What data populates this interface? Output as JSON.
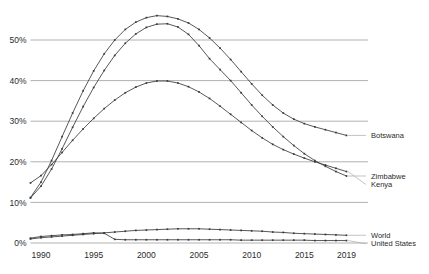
{
  "chart_data": {
    "type": "line",
    "title": "",
    "subtitle": "",
    "xlabel": "",
    "ylabel": "",
    "xlim": [
      1989,
      2020
    ],
    "ylim": [
      0,
      58
    ],
    "grid": "horizontal",
    "legend_position": "right-inline",
    "y_ticks": [
      "0%",
      "10%",
      "20%",
      "30%",
      "40%",
      "50%"
    ],
    "y_tick_values": [
      0,
      10,
      20,
      30,
      40,
      50
    ],
    "x_ticks": [
      "1990",
      "1995",
      "2000",
      "2005",
      "2010",
      "2015",
      "2019"
    ],
    "x_tick_values": [
      1990,
      1995,
      2000,
      2005,
      2010,
      2015,
      2019
    ],
    "x": [
      1989,
      1990,
      1991,
      1992,
      1993,
      1994,
      1995,
      1996,
      1997,
      1998,
      1999,
      2000,
      2001,
      2002,
      2003,
      2004,
      2005,
      2006,
      2007,
      2008,
      2009,
      2010,
      2011,
      2012,
      2013,
      2014,
      2015,
      2016,
      2017,
      2018,
      2019
    ],
    "series": [
      {
        "name": "Botswana",
        "color": "#3a3a3a",
        "values": [
          11.2,
          15.0,
          20.3,
          26.2,
          32.0,
          37.5,
          42.4,
          46.6,
          50.0,
          52.6,
          54.4,
          55.5,
          56.0,
          55.8,
          55.2,
          54.2,
          52.6,
          50.5,
          48.0,
          45.2,
          42.2,
          39.2,
          36.4,
          34.0,
          32.0,
          30.5,
          29.4,
          28.6,
          27.9,
          27.2,
          26.5
        ]
      },
      {
        "name": "Zimbabwe",
        "color": "#3a3a3a",
        "values": [
          11.1,
          14.0,
          18.2,
          23.2,
          28.5,
          33.6,
          38.3,
          42.5,
          46.2,
          49.2,
          51.5,
          53.1,
          53.9,
          54.0,
          53.2,
          51.4,
          48.6,
          45.4,
          42.7,
          40.0,
          37.0,
          34.0,
          31.2,
          28.6,
          26.2,
          24.0,
          22.0,
          20.3,
          18.9,
          17.6,
          16.5
        ]
      },
      {
        "name": "Kenya",
        "color": "#3a3a3a",
        "values": [
          14.8,
          16.6,
          19.3,
          22.3,
          25.3,
          28.1,
          30.7,
          33.1,
          35.2,
          37.0,
          38.4,
          39.4,
          39.9,
          39.9,
          39.4,
          38.5,
          37.2,
          35.6,
          33.7,
          31.7,
          29.7,
          27.7,
          25.9,
          24.3,
          23.0,
          21.9,
          20.9,
          20.0,
          19.2,
          18.4,
          17.6
        ]
      },
      {
        "name": "World",
        "color": "#3a3a3a",
        "values": [
          1.0,
          1.3,
          1.5,
          1.7,
          1.9,
          2.1,
          2.3,
          2.5,
          2.7,
          2.9,
          3.1,
          3.2,
          3.3,
          3.4,
          3.5,
          3.5,
          3.5,
          3.4,
          3.3,
          3.2,
          3.1,
          3.0,
          2.9,
          2.7,
          2.6,
          2.4,
          2.3,
          2.2,
          2.1,
          2.0,
          1.9
        ]
      },
      {
        "name": "United States",
        "color": "#3a3a3a",
        "values": [
          1.2,
          1.6,
          1.8,
          2.0,
          2.1,
          2.3,
          2.5,
          2.4,
          0.9,
          0.8,
          0.8,
          0.8,
          0.8,
          0.8,
          0.8,
          0.8,
          0.8,
          0.8,
          0.8,
          0.8,
          0.7,
          0.7,
          0.7,
          0.7,
          0.7,
          0.7,
          0.7,
          0.6,
          0.6,
          0.6,
          0.6
        ]
      }
    ]
  }
}
